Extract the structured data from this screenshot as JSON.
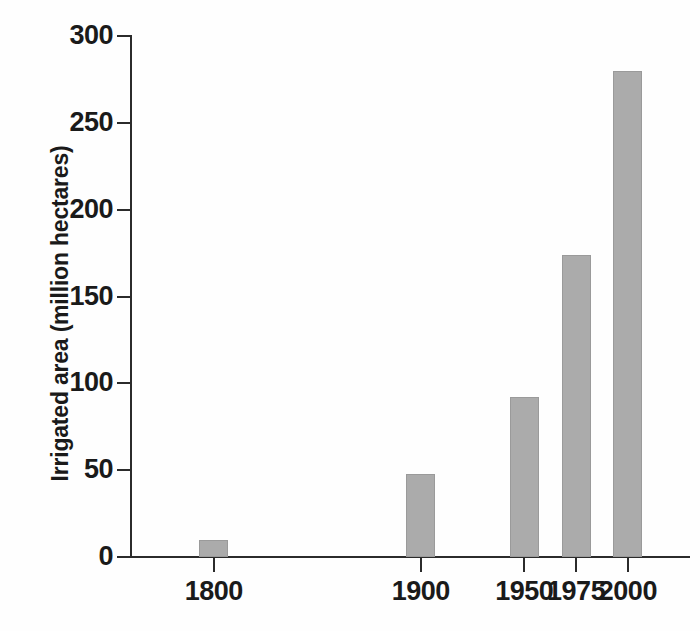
{
  "chart_data": {
    "type": "bar",
    "title": "",
    "subtitle": "",
    "xlabel": "",
    "ylabel": "Irrigated area (million hectares)",
    "categories": [
      "1800",
      "1900",
      "1950",
      "1975",
      "2000"
    ],
    "x": [
      1800,
      1900,
      1950,
      1975,
      2000
    ],
    "values": [
      10,
      48,
      92,
      174,
      280
    ],
    "series": [
      {
        "name": "Irrigated area",
        "values": [
          10,
          48,
          92,
          174,
          280
        ]
      }
    ],
    "ylim": [
      0,
      300
    ],
    "xlim": [
      1760,
      2030
    ],
    "ytick_labels": [
      "0",
      "50",
      "100",
      "150",
      "200",
      "250",
      "300"
    ],
    "ytick_values": [
      0,
      50,
      100,
      150,
      200,
      250,
      300
    ],
    "xtick_labels": [
      "1800",
      "1900",
      "1950",
      "1975",
      "2000"
    ],
    "xtick_values": [
      1800,
      1900,
      1950,
      1975,
      2000
    ],
    "grid": false,
    "legend": false,
    "legend_position": "none",
    "annotations": [],
    "bar_color": "#ababab",
    "bar_edge_color": "#9a9a9a",
    "axis_color": "#2b2b2b",
    "text_color": "#1a1a1a",
    "background_color": "#fefefe"
  },
  "axes": {
    "y_title": "Irrigated area (million hectares)",
    "x_title": ""
  }
}
